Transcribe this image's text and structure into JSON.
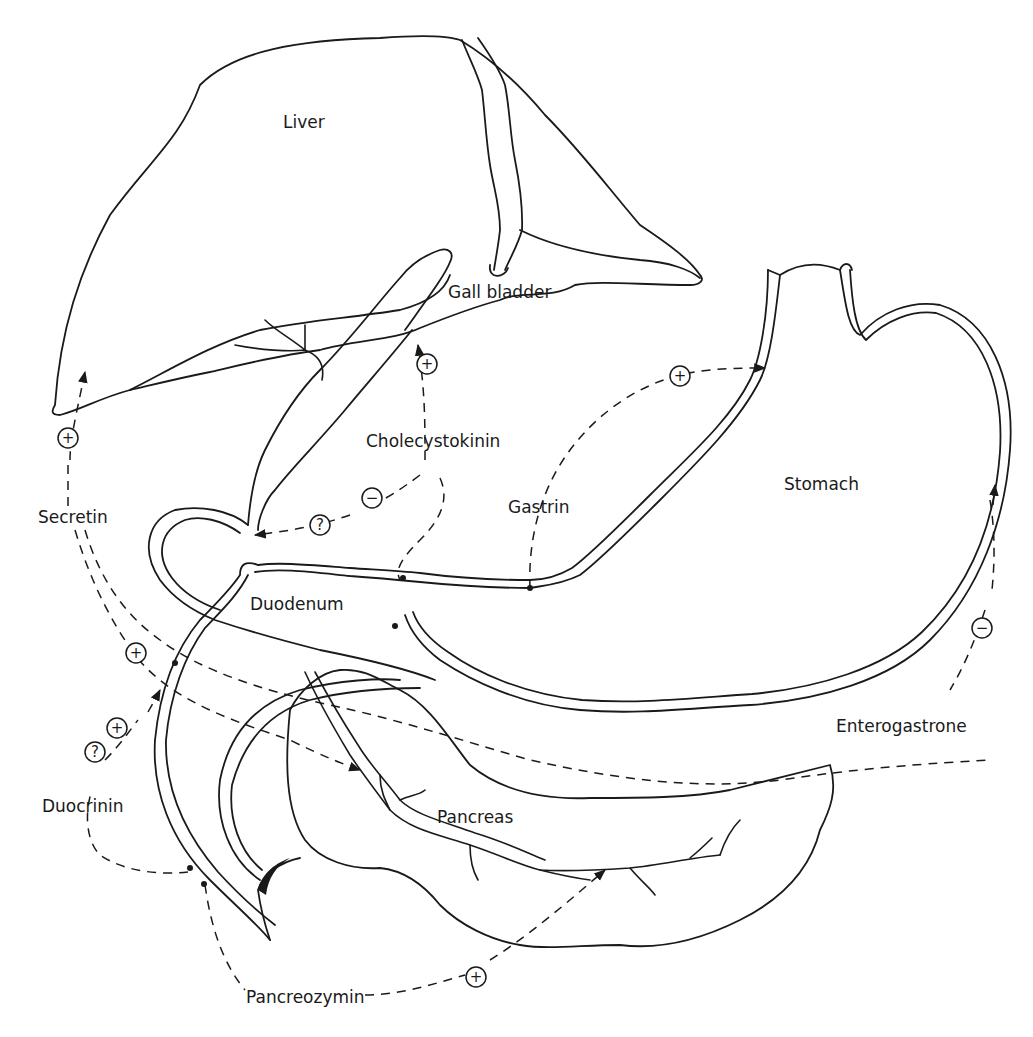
{
  "diagram": {
    "type": "anatomical-hormone-diagram",
    "organs": {
      "liver": "Liver",
      "gall_bladder": "Gall bladder",
      "stomach": "Stomach",
      "duodenum": "Duodenum",
      "pancreas": "Pancreas"
    },
    "hormones": {
      "secretin": "Secretin",
      "cholecystokinin": "Cholecystokinin",
      "gastrin": "Gastrin",
      "enterogastrone": "Enterogastrone",
      "duocrinin": "Duocrinin",
      "pancreozymin": "Pancreozymin"
    },
    "effect_symbols": {
      "plus": "+",
      "minus": "−",
      "unknown": "?"
    },
    "pathways": [
      {
        "hormone": "Secretin",
        "target": "Liver",
        "effect": "+"
      },
      {
        "hormone": "Secretin",
        "target": "Pancreas",
        "effect": "+"
      },
      {
        "hormone": "Cholecystokinin",
        "target": "Gall bladder",
        "effect": "+"
      },
      {
        "hormone": "Cholecystokinin",
        "target": "Sphincter / bile duct",
        "effect": "−",
        "uncertain": "?"
      },
      {
        "hormone": "Gastrin",
        "target": "Stomach",
        "effect": "+"
      },
      {
        "hormone": "Enterogastrone",
        "target": "Stomach",
        "effect": "−"
      },
      {
        "hormone": "Duocrinin",
        "target": "Duodenum",
        "effect": "+",
        "uncertain": "?"
      },
      {
        "hormone": "Pancreozymin",
        "target": "Pancreas",
        "effect": "+"
      }
    ]
  }
}
